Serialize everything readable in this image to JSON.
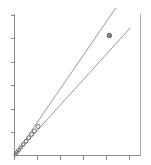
{
  "chart_data": {
    "type": "scatter",
    "title": "",
    "subtitle": "",
    "xlabel": "",
    "ylabel": "",
    "xlim": [
      0,
      6
    ],
    "ylim": [
      0,
      6
    ],
    "grid": false,
    "legend": false,
    "legend_position": "none",
    "x_tick_labels": [
      "",
      "",
      "",
      "",
      "",
      ""
    ],
    "y_tick_labels": [
      "",
      "",
      "",
      "",
      "",
      ""
    ],
    "x_ticks": [
      0,
      1,
      2,
      3,
      4,
      5
    ],
    "y_ticks": [
      0,
      1,
      2,
      3,
      4,
      5
    ],
    "series": [
      {
        "name": "observations",
        "marker": "open-circle",
        "color": "#6e6e6e",
        "x": [
          0.05,
          0.12,
          0.2,
          0.3,
          0.42,
          0.55,
          0.68,
          0.82,
          0.95,
          1.12
        ],
        "y": [
          0.05,
          0.13,
          0.22,
          0.33,
          0.45,
          0.58,
          0.72,
          0.86,
          1.0,
          1.18
        ]
      },
      {
        "name": "outlier",
        "marker": "filled-circle",
        "color": "#8a8a8a",
        "x": [
          4.52
        ],
        "y": [
          4.88
        ]
      }
    ],
    "lines": [
      {
        "name": "steep-fit-line",
        "color": "#9a9a9a",
        "slope": 1.75,
        "intercept": 0,
        "x_start": 0,
        "y_start": 0,
        "x_end": 4.82,
        "y_end": 6.0
      },
      {
        "name": "shallow-fit-line",
        "color": "#9a9a9a",
        "slope": 1.05,
        "intercept": 0,
        "x_start": 0,
        "y_start": 0,
        "x_end": 5.52,
        "y_end": 5.2
      }
    ]
  },
  "figure": {
    "background_color": "#ffffff",
    "axis_color": "#8c8c8c",
    "line_color": "#9a9a9a",
    "marker_color": "#6e6e6e"
  }
}
